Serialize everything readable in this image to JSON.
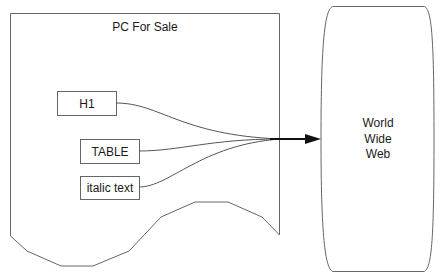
{
  "diagram": {
    "document": {
      "title": "PC For Sale",
      "elements": [
        {
          "label": "H1"
        },
        {
          "label": "TABLE"
        },
        {
          "label": "italic text"
        }
      ]
    },
    "target": {
      "lines": [
        "World",
        "Wide",
        "Web"
      ]
    },
    "colors": {
      "stroke": "#555555",
      "arrow": "#111111",
      "text": "#1a1a1a",
      "background": "#ffffff"
    }
  }
}
